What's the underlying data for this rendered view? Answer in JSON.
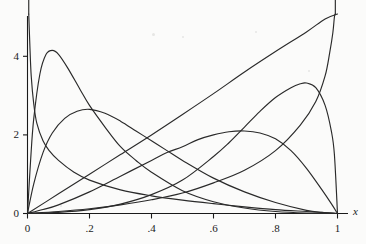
{
  "figure": {
    "running_head": "",
    "background_color": "#fbfbfa",
    "curve_color": "#2a2a2a",
    "axis_color": "#1a1a1a"
  },
  "axes": {
    "x_axis_title": "x",
    "x_ticks": [
      "0",
      ".2",
      ".4",
      ".6",
      ".8",
      "1"
    ],
    "y_ticks": [
      "0",
      "2",
      "4"
    ]
  },
  "chart_data": {
    "type": "line",
    "title": "",
    "subtitle": "",
    "xlabel": "x",
    "ylabel": "",
    "xlim": [
      0,
      1
    ],
    "ylim": [
      0,
      5.2
    ],
    "x_ticks": [
      0,
      0.2,
      0.4,
      0.6,
      0.8,
      1
    ],
    "x_tick_labels": [
      "0",
      ".2",
      ".4",
      ".6",
      ".8",
      "1"
    ],
    "y_ticks": [
      0,
      2,
      4
    ],
    "y_tick_labels": [
      "0",
      "2",
      "4"
    ],
    "grid": false,
    "legend": false,
    "legend_position": "none",
    "series": [
      {
        "name": "beta-a0.5-b2-left-spike",
        "note": "decreasing density diverging at x=0, crosses below 1 by x~0.2, tends to 0 at x=1",
        "x": [
          0.004,
          0.008,
          0.012,
          0.02,
          0.03,
          0.05,
          0.07,
          0.1,
          0.15,
          0.2,
          0.3,
          0.4,
          0.5,
          0.6,
          0.7,
          0.8,
          0.9,
          0.97,
          1.0
        ],
        "y": [
          5.2,
          4.2,
          3.5,
          2.8,
          2.3,
          1.85,
          1.6,
          1.35,
          1.05,
          0.85,
          0.6,
          0.45,
          0.34,
          0.25,
          0.17,
          0.1,
          0.05,
          0.015,
          0.0
        ]
      },
      {
        "name": "beta-peak-0.08",
        "note": "sharp mode near x=0.08, height about 4.15",
        "x": [
          0.0,
          0.01,
          0.02,
          0.04,
          0.06,
          0.08,
          0.1,
          0.13,
          0.17,
          0.2,
          0.25,
          0.3,
          0.35,
          0.4,
          0.5,
          0.6,
          0.7,
          0.8,
          0.9,
          1.0
        ],
        "y": [
          0.0,
          1.35,
          2.4,
          3.55,
          4.05,
          4.15,
          4.05,
          3.7,
          3.15,
          2.75,
          2.2,
          1.7,
          1.35,
          1.05,
          0.58,
          0.3,
          0.14,
          0.05,
          0.01,
          0.0
        ]
      },
      {
        "name": "beta-peak-0.20",
        "note": "broad mode near x=0.20, height about 2.65",
        "x": [
          0.0,
          0.02,
          0.05,
          0.08,
          0.12,
          0.16,
          0.2,
          0.25,
          0.3,
          0.35,
          0.4,
          0.45,
          0.5,
          0.6,
          0.7,
          0.8,
          0.9,
          0.95,
          1.0
        ],
        "y": [
          0.0,
          0.75,
          1.55,
          2.05,
          2.42,
          2.6,
          2.65,
          2.55,
          2.35,
          2.1,
          1.85,
          1.6,
          1.35,
          0.9,
          0.55,
          0.28,
          0.08,
          0.03,
          0.0
        ]
      },
      {
        "name": "beta-peak-0.70",
        "note": "broad mode near x=0.70, height about 2.1; mirror-like companion of the 0.20 curve",
        "x": [
          0.0,
          0.05,
          0.1,
          0.2,
          0.3,
          0.4,
          0.45,
          0.5,
          0.55,
          0.6,
          0.65,
          0.7,
          0.75,
          0.8,
          0.85,
          0.9,
          0.95,
          0.98,
          1.0
        ],
        "y": [
          0.0,
          0.1,
          0.22,
          0.55,
          0.95,
          1.35,
          1.55,
          1.7,
          1.88,
          2.0,
          2.08,
          2.1,
          2.05,
          1.9,
          1.6,
          1.15,
          0.6,
          0.25,
          0.0
        ]
      },
      {
        "name": "beta-peak-0.90",
        "note": "mode near x=0.90, height about 3.3",
        "x": [
          0.0,
          0.1,
          0.2,
          0.3,
          0.4,
          0.5,
          0.6,
          0.65,
          0.7,
          0.75,
          0.8,
          0.85,
          0.88,
          0.9,
          0.93,
          0.96,
          0.98,
          0.99,
          1.0
        ],
        "y": [
          0.0,
          0.03,
          0.1,
          0.24,
          0.48,
          0.85,
          1.45,
          1.8,
          2.2,
          2.6,
          2.95,
          3.2,
          3.3,
          3.32,
          3.2,
          2.75,
          2.1,
          1.5,
          0.0
        ]
      },
      {
        "name": "beta-right-spike",
        "note": "increasing density diverging at x=1",
        "x": [
          0.0,
          0.1,
          0.2,
          0.3,
          0.4,
          0.5,
          0.6,
          0.7,
          0.8,
          0.88,
          0.93,
          0.96,
          0.975,
          0.985,
          0.99,
          0.993
        ],
        "y": [
          0.0,
          0.05,
          0.12,
          0.22,
          0.35,
          0.52,
          0.78,
          1.1,
          1.6,
          2.25,
          2.85,
          3.5,
          4.1,
          4.6,
          5.0,
          5.2
        ]
      },
      {
        "name": "beta-linear-rising",
        "note": "nearly straight line from origin rising to upper right corner",
        "x": [
          0.0,
          0.1,
          0.2,
          0.3,
          0.4,
          0.5,
          0.6,
          0.7,
          0.8,
          0.9,
          0.96,
          1.0
        ],
        "y": [
          0.0,
          0.5,
          1.0,
          1.5,
          2.0,
          2.52,
          3.05,
          3.6,
          4.12,
          4.62,
          4.95,
          5.2
        ]
      }
    ]
  }
}
